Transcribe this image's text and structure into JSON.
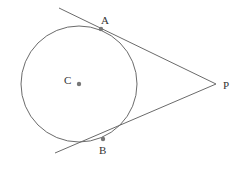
{
  "diagram": {
    "stroke_color": "#6b6b6b",
    "point_color": "#777777",
    "circle": {
      "cx": 79,
      "cy": 84,
      "r": 58
    },
    "labels": {
      "A": "A",
      "B": "B",
      "C": "C",
      "P": "P"
    },
    "points": {
      "A": {
        "x": 101,
        "y": 29
      },
      "B": {
        "x": 103,
        "y": 139
      },
      "C": {
        "x": 79,
        "y": 84
      },
      "P": {
        "x": 216,
        "y": 84
      }
    },
    "tangent_lines": [
      {
        "name": "PA",
        "from": {
          "x": 59,
          "y": 8
        },
        "to": {
          "x": 216,
          "y": 84
        }
      },
      {
        "name": "PB",
        "from": {
          "x": 55,
          "y": 153
        },
        "to": {
          "x": 216,
          "y": 84
        }
      }
    ]
  }
}
